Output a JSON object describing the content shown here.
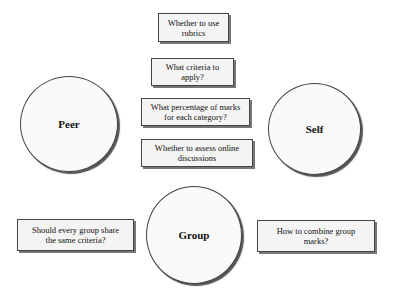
{
  "diagram": {
    "circles": [
      {
        "id": "peer",
        "label": "Peer"
      },
      {
        "id": "self",
        "label": "Self"
      },
      {
        "id": "group",
        "label": "Group"
      }
    ],
    "boxes": [
      {
        "id": "use-rubrics",
        "text": "Whether to use rubrics"
      },
      {
        "id": "criteria",
        "text": "What criteria to apply?"
      },
      {
        "id": "percentage",
        "text": "What percentage of marks for each category?"
      },
      {
        "id": "online-discussions",
        "text": "Whether to assess online discussions"
      },
      {
        "id": "group-share-criteria",
        "text": "Should every group share the same criteria?"
      },
      {
        "id": "combine-group-marks",
        "text": "How to combine group marks?"
      }
    ]
  }
}
